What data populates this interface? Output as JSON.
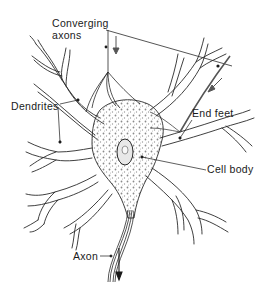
{
  "diagram": {
    "labels": {
      "converging_axons_line1": "Converging",
      "converging_axons_line2": "axons",
      "dendrites": "Dendrites",
      "end_feet": "End feet",
      "cell_body": "Cell body",
      "axon": "Axon"
    },
    "colors": {
      "line": "#2a2a2a",
      "stipple": "#8a8a8a",
      "background": "#ffffff",
      "axon_incoming": "#555555"
    }
  }
}
